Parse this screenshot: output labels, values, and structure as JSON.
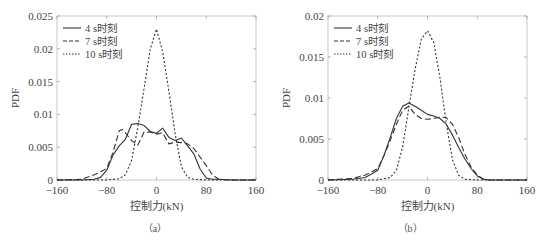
{
  "chart_data": [
    {
      "id": "a",
      "type": "line",
      "panel_label": "（a）",
      "xlabel": "控制力(kN)",
      "ylabel": "PDF",
      "xlim": [
        -160,
        160
      ],
      "ylim": [
        0,
        0.025
      ],
      "xticks": [
        -160,
        -80,
        0,
        80,
        160
      ],
      "xtick_labels": [
        "−160",
        "−80",
        "0",
        "80",
        "160"
      ],
      "yticks": [
        0,
        0.005,
        0.01,
        0.015,
        0.02,
        0.025
      ],
      "ytick_labels": [
        "0",
        "0.005",
        "0.01",
        "0.015",
        "0.02",
        "0.025"
      ],
      "grid": false,
      "legend_position": "upper left",
      "series": [
        {
          "name": "4 s时刻",
          "style": "solid",
          "x": [
            -160,
            -120,
            -100,
            -90,
            -80,
            -70,
            -60,
            -50,
            -40,
            -30,
            -20,
            -10,
            0,
            10,
            20,
            30,
            40,
            50,
            60,
            70,
            80,
            90,
            100,
            120,
            160
          ],
          "y": [
            0,
            0,
            0.0001,
            0.0004,
            0.0015,
            0.0038,
            0.0052,
            0.0062,
            0.0085,
            0.0086,
            0.0083,
            0.0074,
            0.0071,
            0.0079,
            0.0065,
            0.006,
            0.0064,
            0.0052,
            0.004,
            0.0017,
            0.0003,
            0.0001,
            0.0001,
            0,
            0
          ]
        },
        {
          "name": "7 s时刻",
          "style": "dashed",
          "x": [
            -160,
            -120,
            -100,
            -90,
            -80,
            -70,
            -60,
            -55,
            -50,
            -40,
            -30,
            -20,
            -10,
            0,
            10,
            20,
            30,
            40,
            50,
            60,
            70,
            80,
            90,
            100,
            120,
            160
          ],
          "y": [
            0,
            0.0001,
            0.0008,
            0.0012,
            0.0018,
            0.0042,
            0.0075,
            0.0077,
            0.0072,
            0.006,
            0.0053,
            0.0073,
            0.0073,
            0.007,
            0.0072,
            0.0055,
            0.0058,
            0.0057,
            0.0055,
            0.0048,
            0.0035,
            0.0022,
            0.0008,
            0.0001,
            0,
            0
          ]
        },
        {
          "name": "10 s时刻",
          "style": "dotted",
          "x": [
            -160,
            -80,
            -60,
            -50,
            -40,
            -30,
            -20,
            -10,
            0,
            10,
            20,
            30,
            40,
            50,
            60,
            80,
            160
          ],
          "y": [
            0,
            0,
            0.0002,
            0.0008,
            0.003,
            0.008,
            0.014,
            0.02,
            0.023,
            0.0195,
            0.0135,
            0.007,
            0.002,
            0.0004,
            0.0001,
            0,
            0
          ]
        }
      ]
    },
    {
      "id": "b",
      "type": "line",
      "panel_label": "（b）",
      "xlabel": "控制力(kN)",
      "ylabel": "PDF",
      "xlim": [
        -160,
        160
      ],
      "ylim": [
        0,
        0.02
      ],
      "xticks": [
        -160,
        -80,
        0,
        80,
        160
      ],
      "xtick_labels": [
        "−160",
        "−80",
        "0",
        "80",
        "160"
      ],
      "yticks": [
        0,
        0.005,
        0.01,
        0.015,
        0.02
      ],
      "ytick_labels": [
        "0",
        "0.005",
        "0.01",
        "0.015",
        "0.02"
      ],
      "grid": false,
      "legend_position": "upper left",
      "series": [
        {
          "name": "4 s时刻",
          "style": "solid",
          "x": [
            -160,
            -120,
            -100,
            -80,
            -70,
            -60,
            -50,
            -40,
            -30,
            -20,
            -10,
            0,
            10,
            20,
            30,
            40,
            50,
            60,
            70,
            80,
            90,
            100,
            120,
            160
          ],
          "y": [
            0,
            0.0001,
            0.0003,
            0.0012,
            0.003,
            0.0052,
            0.0075,
            0.009,
            0.0094,
            0.009,
            0.0085,
            0.008,
            0.0078,
            0.0075,
            0.0068,
            0.0055,
            0.004,
            0.0026,
            0.0014,
            0.0005,
            0.0001,
            0,
            0,
            0
          ]
        },
        {
          "name": "7 s时刻",
          "style": "dashed",
          "x": [
            -160,
            -120,
            -100,
            -80,
            -70,
            -60,
            -50,
            -40,
            -30,
            -20,
            -10,
            0,
            10,
            20,
            30,
            40,
            50,
            60,
            70,
            80,
            90,
            100,
            120,
            160
          ],
          "y": [
            0,
            0.0002,
            0.0006,
            0.0014,
            0.003,
            0.0048,
            0.0068,
            0.0085,
            0.009,
            0.008,
            0.0075,
            0.0074,
            0.0075,
            0.0077,
            0.0076,
            0.0068,
            0.0052,
            0.0032,
            0.0016,
            0.0006,
            0.0001,
            0,
            0,
            0
          ]
        },
        {
          "name": "10 s时刻",
          "style": "dotted",
          "x": [
            -160,
            -80,
            -60,
            -50,
            -40,
            -30,
            -20,
            -10,
            0,
            10,
            20,
            30,
            40,
            50,
            60,
            80,
            160
          ],
          "y": [
            0,
            0,
            0.0003,
            0.0012,
            0.004,
            0.0088,
            0.0135,
            0.0172,
            0.0182,
            0.0168,
            0.0125,
            0.007,
            0.0025,
            0.0006,
            0.0001,
            0,
            0
          ]
        }
      ]
    }
  ],
  "figure_caption": "图 不同时刻控制力概率密度函数"
}
